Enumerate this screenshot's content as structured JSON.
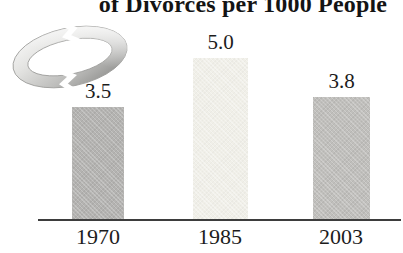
{
  "decorations": {
    "ring_icon": "broken-wedding-ring"
  },
  "chart_data": {
    "type": "bar",
    "title": "of Divorces per 1000 People",
    "categories": [
      "1970",
      "1985",
      "2003"
    ],
    "values": [
      3.5,
      5.0,
      3.8
    ],
    "value_labels": [
      "3.5",
      "5.0",
      "3.8"
    ],
    "xlabel": "",
    "ylabel": "",
    "ylim": [
      0,
      5.5
    ],
    "grid": false,
    "legend": "none",
    "px_per_unit": 32.3,
    "bar_colors": [
      "#b4b3b1",
      "#f0efe8",
      "#c0bfbc"
    ],
    "axis_color": "#3d3d3d",
    "label_color": "#1c1c1c",
    "title_color": "#141414",
    "background": "#ffffff"
  }
}
